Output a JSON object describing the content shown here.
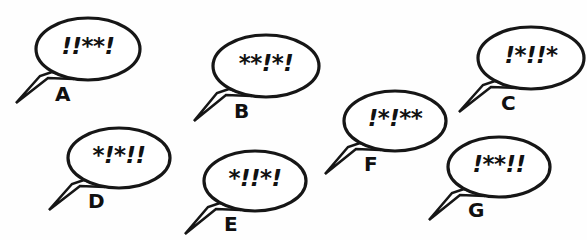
{
  "scene": {
    "width": 587,
    "height": 240,
    "background_color": "#fefefe",
    "ink_color": "#161616",
    "description": "Seven comic speech balloons containing grawlix punctuation, each labeled A through G"
  },
  "bubbles": [
    {
      "label": "A",
      "text": "!!**!",
      "ellipse": {
        "cx": 88,
        "cy": 49,
        "rx": 52,
        "ry": 31
      },
      "text_style": {
        "left": 41,
        "top": 33,
        "width": 94,
        "font_size": 23
      },
      "label_pos": {
        "left": 55,
        "top": 82,
        "font_size": 20
      },
      "tail": "M 52,72 L 40,76 L 16,103 L 48,78 L 74,79 Z"
    },
    {
      "label": "B",
      "text": "**!*!",
      "ellipse": {
        "cx": 266,
        "cy": 66,
        "rx": 53,
        "ry": 31
      },
      "text_style": {
        "left": 219,
        "top": 50,
        "width": 94,
        "font_size": 23
      },
      "label_pos": {
        "left": 234,
        "top": 99,
        "font_size": 20
      },
      "tail": "M 229,89 L 217,93 L 194,121 L 226,95 L 252,96 Z"
    },
    {
      "label": "C",
      "text": "!*!!*",
      "ellipse": {
        "cx": 531,
        "cy": 58,
        "rx": 53,
        "ry": 31
      },
      "text_style": {
        "left": 484,
        "top": 42,
        "width": 94,
        "font_size": 23
      },
      "label_pos": {
        "left": 501,
        "top": 91,
        "font_size": 20
      },
      "tail": "M 495,81 L 483,85 L 459,112 L 491,87 L 517,88 Z"
    },
    {
      "label": "D",
      "text": "*!*!!",
      "ellipse": {
        "cx": 119,
        "cy": 158,
        "rx": 51,
        "ry": 30
      },
      "text_style": {
        "left": 73,
        "top": 142,
        "width": 92,
        "font_size": 23
      },
      "label_pos": {
        "left": 88,
        "top": 189,
        "font_size": 20
      },
      "tail": "M 84,180 L 72,184 L 49,210 L 80,186 L 105,187 Z"
    },
    {
      "label": "E",
      "text": "*!!*!",
      "ellipse": {
        "cx": 255,
        "cy": 181,
        "rx": 51,
        "ry": 30
      },
      "text_style": {
        "left": 209,
        "top": 165,
        "width": 92,
        "font_size": 23
      },
      "label_pos": {
        "left": 224,
        "top": 212,
        "font_size": 20
      },
      "tail": "M 220,203 L 208,207 L 185,234 L 216,209 L 241,210 Z"
    },
    {
      "label": "F",
      "text": "!*!**",
      "ellipse": {
        "cx": 395,
        "cy": 121,
        "rx": 51,
        "ry": 30
      },
      "text_style": {
        "left": 349,
        "top": 105,
        "width": 92,
        "font_size": 23
      },
      "label_pos": {
        "left": 364,
        "top": 152,
        "font_size": 20
      },
      "tail": "M 360,143 L 348,147 L 325,174 L 356,149 L 381,150 Z"
    },
    {
      "label": "G",
      "text": "!**!!",
      "ellipse": {
        "cx": 499,
        "cy": 167,
        "rx": 51,
        "ry": 30
      },
      "text_style": {
        "left": 453,
        "top": 151,
        "width": 92,
        "font_size": 23
      },
      "label_pos": {
        "left": 468,
        "top": 198,
        "font_size": 20
      },
      "tail": "M 464,189 L 452,193 L 429,220 L 460,195 L 485,196 Z"
    }
  ]
}
